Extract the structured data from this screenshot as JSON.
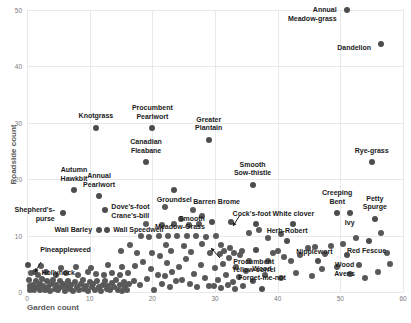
{
  "chart_data": {
    "type": "scatter",
    "title": "",
    "xlabel": "Garden count",
    "ylabel": "Roadside count",
    "xlim": [
      0,
      60
    ],
    "ylim": [
      0,
      50
    ],
    "xticks": [
      0,
      10,
      20,
      30,
      40,
      50,
      60
    ],
    "yticks": [
      0,
      10,
      20,
      30,
      40,
      50
    ],
    "grid": true,
    "legend": "none",
    "marker_color": "#595959",
    "labeled_points": [
      {
        "label": "Annual\nMeadow-grass",
        "x": 51,
        "y": 50,
        "lx": -10,
        "ly": 0,
        "align": "r"
      },
      {
        "label": "Dandelion",
        "x": 56.5,
        "y": 44,
        "lx": -10,
        "ly": 4,
        "align": "r"
      },
      {
        "label": "Knotgrass",
        "x": 11,
        "y": 29,
        "lx": 0,
        "ly": -12,
        "align": "c"
      },
      {
        "label": "Procumbent\nPearlwort",
        "x": 20,
        "y": 29,
        "lx": 0,
        "ly": -20,
        "align": "c"
      },
      {
        "label": "Canadian\nFleabane",
        "x": 19,
        "y": 23,
        "lx": 0,
        "ly": -20,
        "align": "c"
      },
      {
        "label": "Greater\nPlantain",
        "x": 29,
        "y": 27,
        "lx": 0,
        "ly": -20,
        "align": "c"
      },
      {
        "label": "Rye-grass",
        "x": 55,
        "y": 23,
        "lx": 0,
        "ly": -11,
        "align": "c"
      },
      {
        "label": "Smooth\nSow-thistle",
        "x": 36,
        "y": 19,
        "lx": 0,
        "ly": -20,
        "align": "c"
      },
      {
        "label": "Autumn\nHawkbit",
        "x": 7.5,
        "y": 18,
        "lx": 0,
        "ly": -20,
        "align": "c"
      },
      {
        "label": "Annual\nPearlwort",
        "x": 11.5,
        "y": 17,
        "lx": 0,
        "ly": -20,
        "align": "c"
      },
      {
        "label": "Groundsel",
        "x": 23.5,
        "y": 18,
        "lx": 0,
        "ly": 10,
        "align": "c"
      },
      {
        "label": "Shepherd's-\npurse",
        "x": 5.7,
        "y": 14,
        "lx": -8,
        "ly": -3,
        "align": "r"
      },
      {
        "label": "Dove's-foot\nCrane's-bill",
        "x": 12.5,
        "y": 14.5,
        "lx": 6,
        "ly": -3,
        "align": "l"
      },
      {
        "label": "Creeping\nBent",
        "x": 49.5,
        "y": 14,
        "lx": 0,
        "ly": -20,
        "align": "c"
      },
      {
        "label": "Petty\nSpurge",
        "x": 55.5,
        "y": 13,
        "lx": 0,
        "ly": -20,
        "align": "c"
      },
      {
        "label": "Ivy",
        "x": 51.5,
        "y": 14,
        "lx": 0,
        "ly": 10,
        "align": "c"
      },
      {
        "label": "Wall Barley",
        "x": 11.5,
        "y": 11,
        "lx": -7,
        "ly": 0,
        "align": "r"
      },
      {
        "label": "Wall Speedwell",
        "x": 12.8,
        "y": 11,
        "lx": 6,
        "ly": 0,
        "align": "l"
      },
      {
        "label": "Smooth\nMeadow-Grass",
        "x": 29.5,
        "y": 12.5,
        "lx": -7,
        "ly": -3,
        "align": "r"
      },
      {
        "label": "Barren Brome",
        "x": 32.5,
        "y": 12.5,
        "lx": -14,
        "ly": -20,
        "align": "c"
      },
      {
        "label": "Cock's-foot",
        "x": 36.5,
        "y": 12,
        "lx": -4,
        "ly": -10,
        "align": "c"
      },
      {
        "label": "White clover",
        "x": 42.5,
        "y": 12,
        "lx": 0,
        "ly": -10,
        "align": "c"
      },
      {
        "label": "Herb-Robert",
        "x": 41.5,
        "y": 9,
        "lx": 0,
        "ly": -10,
        "align": "c"
      },
      {
        "label": "Red Fescue",
        "x": 54.5,
        "y": 9,
        "lx": -2,
        "ly": 10,
        "align": "c"
      },
      {
        "label": "Nipplewort",
        "x": 46.5,
        "y": 5.5,
        "lx": -4,
        "ly": -9,
        "align": "c"
      },
      {
        "label": "Wood\nAvens",
        "x": 51,
        "y": 6.5,
        "lx": -2,
        "ly": 10,
        "align": "c"
      },
      {
        "label": "Procumbent\nYellow-sorrel",
        "x": 36.5,
        "y": 7.5,
        "lx": -2,
        "ly": 12,
        "align": "c"
      },
      {
        "label": "Wood\nForget-me-not",
        "x": 37.5,
        "y": 0.5,
        "lx": 0,
        "ly": -20,
        "align": "c"
      },
      {
        "label": "Pineappleweed",
        "x": 0.2,
        "y": 4.8,
        "lx": 12,
        "ly": -15,
        "align": "l"
      },
      {
        "label": "Hollyhock",
        "x": 1.2,
        "y": 3.5,
        "lx": 7,
        "ly": 1,
        "align": "l"
      }
    ],
    "unlabeled_points": [
      [
        0.3,
        2.2
      ],
      [
        0.4,
        1.0
      ],
      [
        0.5,
        0.3
      ],
      [
        1.0,
        1.2
      ],
      [
        1.1,
        0.3
      ],
      [
        1.4,
        2.0
      ],
      [
        1.6,
        0.8
      ],
      [
        2.0,
        1.5
      ],
      [
        2.1,
        0.3
      ],
      [
        2.4,
        2.3
      ],
      [
        2.6,
        1.1
      ],
      [
        2.9,
        0.4
      ],
      [
        3.2,
        1.9
      ],
      [
        3.4,
        0.9
      ],
      [
        3.6,
        0.2
      ],
      [
        3.9,
        1.4
      ],
      [
        4.2,
        2.1
      ],
      [
        4.4,
        0.6
      ],
      [
        4.7,
        1.2
      ],
      [
        5.0,
        0.3
      ],
      [
        5.2,
        1.9
      ],
      [
        5.5,
        0.8
      ],
      [
        5.8,
        1.5
      ],
      [
        6.0,
        0.2
      ],
      [
        6.3,
        1.0
      ],
      [
        6.6,
        2.0
      ],
      [
        6.9,
        0.5
      ],
      [
        7.1,
        1.3
      ],
      [
        7.4,
        0.2
      ],
      [
        7.7,
        1.8
      ],
      [
        8.0,
        0.9
      ],
      [
        8.3,
        0.3
      ],
      [
        8.6,
        1.5
      ],
      [
        8.9,
        2.2
      ],
      [
        9.1,
        0.6
      ],
      [
        9.4,
        1.1
      ],
      [
        9.7,
        0.2
      ],
      [
        10.0,
        1.7
      ],
      [
        10.3,
        0.8
      ],
      [
        10.6,
        1.4
      ],
      [
        10.9,
        0.3
      ],
      [
        11.2,
        2.0
      ],
      [
        11.5,
        0.9
      ],
      [
        11.8,
        0.2
      ],
      [
        12.1,
        1.3
      ],
      [
        12.4,
        1.9
      ],
      [
        12.7,
        0.5
      ],
      [
        13.0,
        1.1
      ],
      [
        13.3,
        0.3
      ],
      [
        13.6,
        1.6
      ],
      [
        13.9,
        0.8
      ],
      [
        14.2,
        2.1
      ],
      [
        14.5,
        0.4
      ],
      [
        14.8,
        1.2
      ],
      [
        15.1,
        0.2
      ],
      [
        15.4,
        1.8
      ],
      [
        15.7,
        0.9
      ],
      [
        16.0,
        0.3
      ],
      [
        16.3,
        1.4
      ],
      [
        0.6,
        3.4
      ],
      [
        1.8,
        3.1
      ],
      [
        3.0,
        3.6
      ],
      [
        4.6,
        3.0
      ],
      [
        6.2,
        3.3
      ],
      [
        8.2,
        3.1
      ],
      [
        9.8,
        3.5
      ],
      [
        11.0,
        3.2
      ],
      [
        12.3,
        3.0
      ],
      [
        13.5,
        3.4
      ],
      [
        14.9,
        3.1
      ],
      [
        16.1,
        3.3
      ],
      [
        2.2,
        4.6
      ],
      [
        5.4,
        4.2
      ],
      [
        7.8,
        4.5
      ],
      [
        10.2,
        4.3
      ],
      [
        12.9,
        4.7
      ],
      [
        15.2,
        4.4
      ],
      [
        17.0,
        2.0
      ],
      [
        17.3,
        4.6
      ],
      [
        18.0,
        1.2
      ],
      [
        18.5,
        5.4
      ],
      [
        19.2,
        2.3
      ],
      [
        19.8,
        4.1
      ],
      [
        20.3,
        0.4
      ],
      [
        20.9,
        3.0
      ],
      [
        21.2,
        6.3
      ],
      [
        21.6,
        1.5
      ],
      [
        22.0,
        2.8
      ],
      [
        22.4,
        5.1
      ],
      [
        22.8,
        0.8
      ],
      [
        23.2,
        3.6
      ],
      [
        23.8,
        1.9
      ],
      [
        24.2,
        4.4
      ],
      [
        24.8,
        2.2
      ],
      [
        25.3,
        5.8
      ],
      [
        26.0,
        1.4
      ],
      [
        26.6,
        3.2
      ],
      [
        27.2,
        0.9
      ],
      [
        27.8,
        4.8
      ],
      [
        28.4,
        2.5
      ],
      [
        29.0,
        1.1
      ],
      [
        15.0,
        7.2
      ],
      [
        16.5,
        8.3
      ],
      [
        18.2,
        9.9
      ],
      [
        19.5,
        9.8
      ],
      [
        21.0,
        10.0
      ],
      [
        22.5,
        9.9
      ],
      [
        24.0,
        10.0
      ],
      [
        25.5,
        9.9
      ],
      [
        27.0,
        10.0
      ],
      [
        28.6,
        9.8
      ],
      [
        30.2,
        10.0
      ],
      [
        17.5,
        6.9
      ],
      [
        20.0,
        7.0
      ],
      [
        23.0,
        7.2
      ],
      [
        26.2,
        7.1
      ],
      [
        29.2,
        7.0
      ],
      [
        22.2,
        8.4
      ],
      [
        25.0,
        8.2
      ],
      [
        28.0,
        8.5
      ],
      [
        31.0,
        8.3
      ],
      [
        19.0,
        12.0
      ],
      [
        21.5,
        11.8
      ],
      [
        23.5,
        12.1
      ],
      [
        25.8,
        11.9
      ],
      [
        27.5,
        12.0
      ],
      [
        30.0,
        4.2
      ],
      [
        30.5,
        2.1
      ],
      [
        31.2,
        5.0
      ],
      [
        31.8,
        3.1
      ],
      [
        32.2,
        6.1
      ],
      [
        32.8,
        1.8
      ],
      [
        33.4,
        4.5
      ],
      [
        33.9,
        2.6
      ],
      [
        34.3,
        7.2
      ],
      [
        34.9,
        3.8
      ],
      [
        35.5,
        5.5
      ],
      [
        36.0,
        2.0
      ],
      [
        30.8,
        6.8
      ],
      [
        31.5,
        7.3
      ],
      [
        32.4,
        7.8
      ],
      [
        33.0,
        7.0
      ],
      [
        34.0,
        6.5
      ],
      [
        29.8,
        1.0
      ],
      [
        31.0,
        0.7
      ],
      [
        32.0,
        1.3
      ],
      [
        33.2,
        0.5
      ],
      [
        34.5,
        1.1
      ],
      [
        38.5,
        5.5
      ],
      [
        39.2,
        7.0
      ],
      [
        40.0,
        7.3
      ],
      [
        41.0,
        6.2
      ],
      [
        42.2,
        5.5
      ],
      [
        43.5,
        6.5
      ],
      [
        44.8,
        7.8
      ],
      [
        46.0,
        8.0
      ],
      [
        47.5,
        6.8
      ],
      [
        48.5,
        8.2
      ],
      [
        38.0,
        3.0
      ],
      [
        40.5,
        2.5
      ],
      [
        43.0,
        3.4
      ],
      [
        45.5,
        2.8
      ],
      [
        47.0,
        4.0
      ],
      [
        49.5,
        4.5
      ],
      [
        51.5,
        3.2
      ],
      [
        53.0,
        4.8
      ],
      [
        54.0,
        2.5
      ],
      [
        56.0,
        3.5
      ],
      [
        50.5,
        8.5
      ],
      [
        52.5,
        9.5
      ],
      [
        56.5,
        10.5
      ],
      [
        57.5,
        7.0
      ],
      [
        58.0,
        5.0
      ],
      [
        35.5,
        10.5
      ],
      [
        37.0,
        11.0
      ],
      [
        38.5,
        9.5
      ],
      [
        40.5,
        10.2
      ],
      [
        24.5,
        13.0
      ],
      [
        26.5,
        14.5
      ],
      [
        28.0,
        13.5
      ],
      [
        22.0,
        15.0
      ]
    ]
  }
}
